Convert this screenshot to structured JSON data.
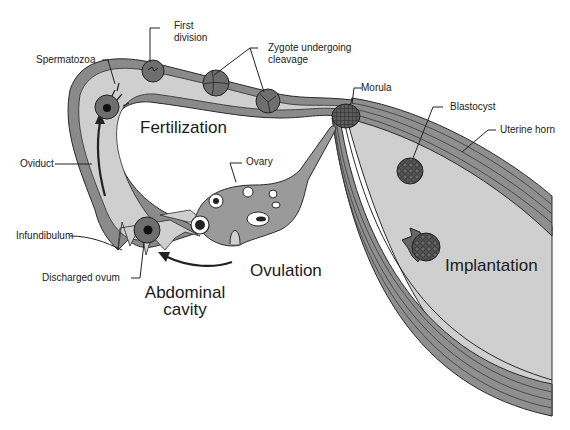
{
  "diagram": {
    "labels": {
      "spermatozoa": "Spermatozoa",
      "first_division_line1": "First",
      "first_division_line2": "division",
      "zygote_line1": "Zygote undergoing",
      "zygote_line2": "cleavage",
      "morula": "Morula",
      "blastocyst": "Blastocyst",
      "uterine_horn": "Uterine horn",
      "oviduct": "Oviduct",
      "infundibulum": "Infundibulum",
      "discharged_ovum": "Discharged ovum",
      "ovary": "Ovary"
    },
    "process_labels": {
      "fertilization": "Fertilization",
      "ovulation": "Ovulation",
      "abdominal_line1": "Abdominal",
      "abdominal_line2": "cavity",
      "implantation": "Implantation"
    },
    "colors": {
      "wall_dark": "#8a8a8a",
      "lumen_light": "#cfcfcf",
      "cell_dark": "#6e6e6e",
      "outline": "#2a2a2a",
      "background": "#ffffff"
    }
  }
}
